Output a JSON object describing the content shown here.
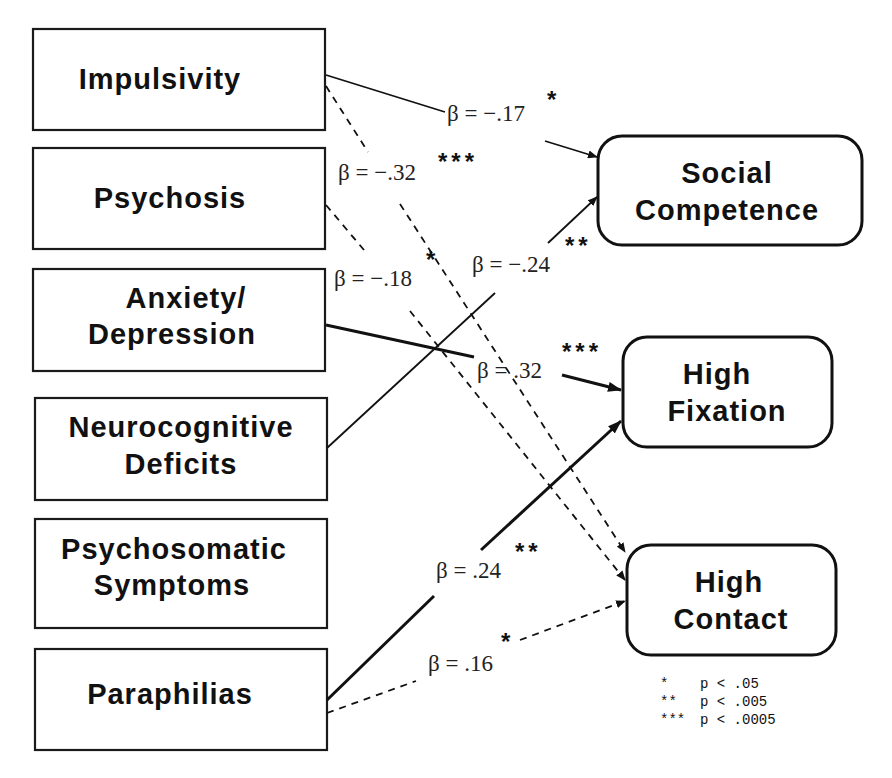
{
  "predictors": [
    {
      "id": "impulsivity",
      "lines": [
        "Impulsivity"
      ]
    },
    {
      "id": "psychosis",
      "lines": [
        "Psychosis"
      ]
    },
    {
      "id": "anxiety-depression",
      "lines": [
        "Anxiety/",
        "Depression"
      ]
    },
    {
      "id": "neurocognitive-deficits",
      "lines": [
        "Neurocognitive",
        "Deficits"
      ]
    },
    {
      "id": "psychosomatic-symptoms",
      "lines": [
        "Psychosomatic",
        "Symptoms"
      ]
    },
    {
      "id": "paraphilias",
      "lines": [
        "Paraphilias"
      ]
    }
  ],
  "outcomes": [
    {
      "id": "social-competence",
      "lines": [
        "Social",
        "Competence"
      ]
    },
    {
      "id": "high-fixation",
      "lines": [
        "High",
        "Fixation"
      ]
    },
    {
      "id": "high-contact",
      "lines": [
        "High",
        "Contact"
      ]
    }
  ],
  "paths": [
    {
      "from": "Impulsivity",
      "to": "Social Competence",
      "beta": "β = −.17",
      "stars": "*",
      "style": "solid"
    },
    {
      "from": "Impulsivity",
      "to": "High Contact",
      "beta": "β = −.32",
      "stars": "***",
      "style": "dashed"
    },
    {
      "from": "Psychosis",
      "to": "High Contact",
      "beta": "β = −.18",
      "stars": "*",
      "style": "dashed"
    },
    {
      "from": "Neurocognitive Deficits",
      "to": "Social Competence",
      "beta": "β = −.24",
      "stars": "**",
      "style": "solid"
    },
    {
      "from": "Anxiety/Depression",
      "to": "High Fixation",
      "beta": "β = .32",
      "stars": "***",
      "style": "bold"
    },
    {
      "from": "Paraphilias",
      "to": "High Fixation",
      "beta": "β = .24",
      "stars": "**",
      "style": "bold"
    },
    {
      "from": "Paraphilias",
      "to": "High Contact",
      "beta": "β = .16",
      "stars": "*",
      "style": "dashed"
    }
  ],
  "legend": [
    {
      "stars": "*",
      "text": "p < .05"
    },
    {
      "stars": "**",
      "text": "p < .005"
    },
    {
      "stars": "***",
      "text": "p < .0005"
    }
  ]
}
